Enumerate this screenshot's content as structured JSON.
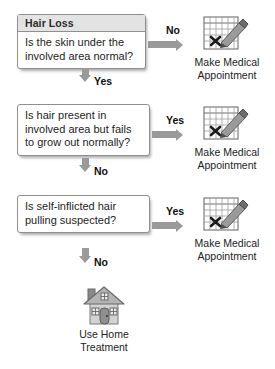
{
  "flowchart": {
    "title": "Hair Loss",
    "nodes": [
      {
        "id": "node-1",
        "header": "Hair Loss",
        "question": "Is the skin under the involved area normal?"
      },
      {
        "id": "node-2",
        "header": "",
        "question": "Is hair present in involved area but fails to grow out normally?"
      },
      {
        "id": "node-3",
        "header": "",
        "question": "Is self-inflicted hair pulling suspected?"
      }
    ],
    "branches": {
      "no_label": "No",
      "yes_label": "Yes",
      "node1_right": "No",
      "node1_down": "Yes",
      "node2_right": "Yes",
      "node2_down": "No",
      "node3_right": "Yes",
      "node3_down": "No"
    },
    "outcomes": [
      {
        "id": "outcome-1",
        "label": "Make Medical Appointment",
        "icon": "calendar-pencil-icon"
      },
      {
        "id": "outcome-2",
        "label": "Make Medical Appointment",
        "icon": "calendar-pencil-icon"
      },
      {
        "id": "outcome-3",
        "label": "Make Medical Appointment",
        "icon": "calendar-pencil-icon"
      }
    ],
    "final_outcome": {
      "id": "outcome-home",
      "label": "Use Home Treatment",
      "icon": "house-icon"
    },
    "colors": {
      "box_border": "#8f8f8f",
      "header_fill": "#e3e3e3",
      "arrow": "#9a9a9a",
      "text": "#1d1d1d",
      "icon_gray": "#8c8c8c",
      "icon_dark": "#5a5a5a",
      "background": "#ffffff"
    }
  }
}
